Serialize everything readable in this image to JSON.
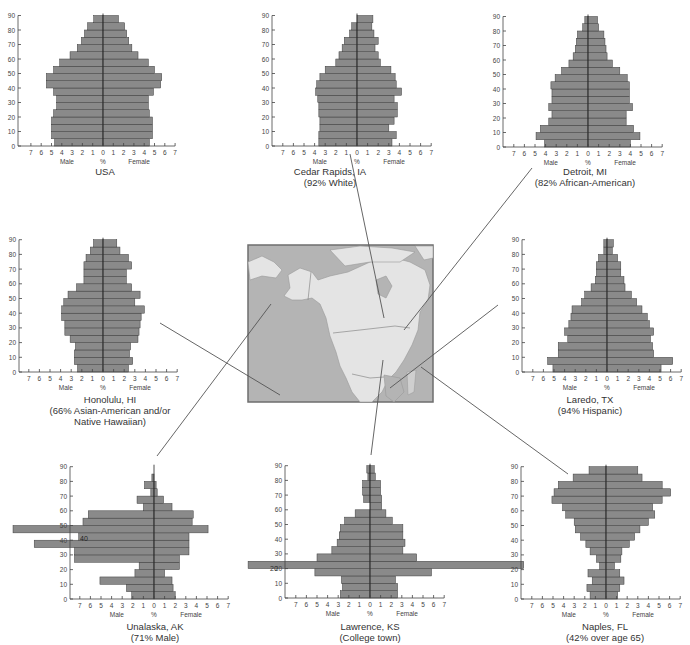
{
  "figure": {
    "bar_color": "#8a8a8a",
    "bar_edge": "#3c3c3c",
    "axis_color": "#444444",
    "connector_color": "#555555",
    "map": {
      "ocean_color": "#b4b4b4",
      "land_color": "#e4e4e4",
      "frame_color": "#6e6e6e"
    },
    "axis": {
      "y_ticks": [
        0,
        10,
        20,
        30,
        40,
        50,
        60,
        70,
        80,
        90
      ],
      "x_ticks": [
        "7",
        "6",
        "5",
        "4",
        "3",
        "2",
        "1",
        "0",
        "1",
        "2",
        "3",
        "4",
        "5",
        "6",
        "7"
      ],
      "x_unit": "%",
      "male_label": "Male",
      "female_label": "Female"
    }
  },
  "chart_data": [
    {
      "type": "bar",
      "orientation": "horizontal-pyramid",
      "title": "USA",
      "subtitle": "",
      "xlabel": "%",
      "ylabel": "Age",
      "xlim": [
        -7,
        7
      ],
      "ylim": [
        0,
        90
      ],
      "age_groups": [
        0,
        5,
        10,
        15,
        20,
        25,
        30,
        35,
        40,
        45,
        50,
        55,
        60,
        65,
        70,
        75,
        80,
        85
      ],
      "series": [
        {
          "name": "Male",
          "values": [
            4.7,
            5.0,
            5.0,
            5.0,
            4.8,
            4.5,
            4.5,
            4.8,
            5.5,
            5.5,
            4.8,
            4.2,
            3.2,
            2.5,
            2.1,
            1.8,
            1.5,
            0.9,
            0.6
          ]
        },
        {
          "name": "Female",
          "values": [
            4.5,
            4.8,
            4.8,
            4.8,
            4.5,
            4.4,
            4.4,
            4.9,
            5.6,
            5.7,
            5.0,
            4.4,
            3.4,
            2.8,
            2.5,
            2.3,
            2.1,
            1.5,
            1.5
          ]
        }
      ]
    },
    {
      "type": "bar",
      "orientation": "horizontal-pyramid",
      "title": "Cedar Rapids, IA",
      "subtitle": "(92% White)",
      "xlabel": "%",
      "ylabel": "Age",
      "xlim": [
        -7,
        7
      ],
      "ylim": [
        0,
        90
      ],
      "series": [
        {
          "name": "Male",
          "values": [
            3.6,
            3.6,
            3.5,
            3.5,
            3.6,
            3.6,
            3.7,
            3.9,
            3.8,
            3.5,
            3.0,
            2.0,
            1.7,
            1.4,
            1.2,
            0.7,
            0.5
          ]
        },
        {
          "name": "Female",
          "values": [
            3.3,
            3.7,
            3.0,
            3.5,
            3.8,
            3.8,
            3.5,
            4.2,
            3.7,
            3.6,
            3.2,
            2.2,
            2.0,
            1.7,
            2.0,
            1.6,
            1.4,
            1.5
          ]
        }
      ]
    },
    {
      "type": "bar",
      "orientation": "horizontal-pyramid",
      "title": "Detroit, MI",
      "subtitle": "(82% African-American)",
      "xlabel": "%",
      "ylabel": "Age",
      "xlim": [
        -7,
        7
      ],
      "ylim": [
        0,
        90
      ],
      "series": [
        {
          "name": "Male",
          "values": [
            4.1,
            4.9,
            4.5,
            3.7,
            3.4,
            3.7,
            3.4,
            3.4,
            3.5,
            3.1,
            2.5,
            1.8,
            1.4,
            1.2,
            1.1,
            1.0,
            0.5,
            0.3
          ]
        },
        {
          "name": "Female",
          "values": [
            4.0,
            4.9,
            4.3,
            3.6,
            3.6,
            4.2,
            3.9,
            3.9,
            3.9,
            3.7,
            3.0,
            2.3,
            1.8,
            1.7,
            1.6,
            1.5,
            1.0,
            0.9
          ]
        }
      ]
    },
    {
      "type": "bar",
      "orientation": "horizontal-pyramid",
      "title": "Honolulu, HI",
      "subtitle": "(66% Asian-American and/or Native Hawaiian)",
      "xlabel": "%",
      "ylabel": "Age",
      "xlim": [
        -7,
        7
      ],
      "ylim": [
        0,
        90
      ],
      "series": [
        {
          "name": "Male",
          "values": [
            2.4,
            2.7,
            2.7,
            2.6,
            3.1,
            3.6,
            3.6,
            3.9,
            3.9,
            3.7,
            3.3,
            2.5,
            1.8,
            1.8,
            1.8,
            1.6,
            1.2,
            0.9
          ]
        },
        {
          "name": "Female",
          "values": [
            2.4,
            2.8,
            2.5,
            2.6,
            3.3,
            3.4,
            3.5,
            3.6,
            3.9,
            3.0,
            3.5,
            2.7,
            2.2,
            2.2,
            2.7,
            2.4,
            1.6,
            1.3
          ]
        }
      ]
    },
    {
      "type": "bar",
      "orientation": "horizontal-pyramid",
      "title": "Laredo, TX",
      "subtitle": "(94% Hispanic)",
      "xlabel": "%",
      "ylabel": "Age",
      "xlim": [
        -7,
        7
      ],
      "ylim": [
        0,
        90
      ],
      "series": [
        {
          "name": "Male",
          "values": [
            5.1,
            5.6,
            4.6,
            4.6,
            3.7,
            4.0,
            3.6,
            3.4,
            3.3,
            2.4,
            2.1,
            1.5,
            1.1,
            1.0,
            1.0,
            0.8,
            0.3,
            0.3
          ]
        },
        {
          "name": "Female",
          "values": [
            5.1,
            6.2,
            4.4,
            4.3,
            4.1,
            4.4,
            4.0,
            3.8,
            3.3,
            2.8,
            2.3,
            1.7,
            1.6,
            1.3,
            1.3,
            1.0,
            0.5,
            0.6
          ]
        }
      ]
    },
    {
      "type": "bar",
      "orientation": "horizontal-pyramid",
      "title": "Unalaska, AK",
      "subtitle": "(71% Male)",
      "xlabel": "%",
      "ylabel": "Age",
      "xlim": [
        -7,
        7
      ],
      "ylim": [
        0,
        90
      ],
      "series": [
        {
          "name": "Male",
          "values": [
            2.1,
            2.6,
            5.1,
            1.8,
            1.4,
            7.5,
            7.5,
            11.3,
            7.1,
            13.3,
            6.7,
            6.2,
            1.0,
            1.6,
            0.3,
            0.9,
            0.2,
            0.0
          ]
        },
        {
          "name": "Female",
          "values": [
            2.0,
            1.8,
            1.7,
            1.0,
            2.4,
            2.4,
            3.3,
            3.3,
            3.3,
            5.1,
            3.6,
            3.7,
            1.7,
            0.9,
            0.3,
            0.2,
            0.0,
            0.0
          ]
        }
      ],
      "notes": "Male bars at ages ~25 and ~40-45 extend beyond left axis edge (cut off)"
    },
    {
      "type": "bar",
      "orientation": "horizontal-pyramid",
      "title": "Lawrence, KS",
      "subtitle": "(College town)",
      "xlabel": "%",
      "ylabel": "Age",
      "xlim": [
        -7,
        7
      ],
      "ylim": [
        0,
        90
      ],
      "series": [
        {
          "name": "Male",
          "values": [
            2.8,
            2.6,
            2.7,
            5.2,
            11.5,
            5.0,
            3.6,
            3.1,
            2.9,
            2.8,
            2.4,
            1.4,
            0.0,
            0.6,
            0.7,
            0.7,
            0.2,
            0.3
          ]
        },
        {
          "name": "Female",
          "values": [
            2.6,
            2.6,
            2.4,
            5.8,
            14.5,
            4.4,
            3.1,
            3.3,
            3.1,
            3.1,
            2.1,
            1.5,
            1.1,
            1.1,
            1.0,
            1.0,
            0.5,
            0.4
          ]
        }
      ],
      "notes": "Age 20-25 bars extend beyond both axis edges (cut off)"
    },
    {
      "type": "bar",
      "orientation": "horizontal-pyramid",
      "title": "Naples, FL",
      "subtitle": "(42% over age 65)",
      "xlabel": "%",
      "ylabel": "Age",
      "xlim": [
        -7,
        7
      ],
      "ylim": [
        0,
        90
      ],
      "series": [
        {
          "name": "Male",
          "values": [
            1.5,
            1.8,
            1.3,
            1.7,
            0.6,
            0.9,
            1.5,
            1.9,
            2.4,
            2.9,
            3.0,
            3.8,
            4.1,
            5.1,
            4.9,
            4.5,
            3.1,
            1.6
          ]
        },
        {
          "name": "Female",
          "values": [
            1.1,
            1.3,
            1.7,
            1.3,
            0.8,
            1.4,
            1.5,
            2.2,
            2.7,
            3.2,
            4.0,
            4.6,
            4.4,
            5.3,
            6.1,
            5.3,
            3.4,
            3.0
          ]
        }
      ]
    }
  ],
  "captions": {
    "usa": {
      "title": "USA",
      "subtitle": ""
    },
    "cedar": {
      "title": "Cedar Rapids, IA",
      "subtitle": "(92% White)"
    },
    "detroit": {
      "title": "Detroit, MI",
      "subtitle": "(82% African-American)"
    },
    "honolulu": {
      "title": "Honolulu, HI",
      "subtitle": "(66% Asian-American and/or",
      "subtitle2": "Native Hawaiian)"
    },
    "laredo": {
      "title": "Laredo, TX",
      "subtitle": "(94% Hispanic)"
    },
    "unalaska": {
      "title": "Unalaska, AK",
      "subtitle": "(71% Male)"
    },
    "lawrence": {
      "title": "Lawrence, KS",
      "subtitle": "(College town)"
    },
    "naples": {
      "title": "Naples, FL",
      "subtitle": "(42% over age 65)"
    }
  },
  "overlay_labels": {
    "unalaska_40": "40",
    "unalaska_30": "30",
    "unalaska_60": "0",
    "lawrence_20": "20"
  }
}
